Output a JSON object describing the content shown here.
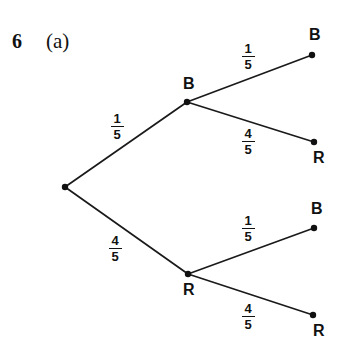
{
  "figure": {
    "question_number": "6",
    "part_label": "(a)",
    "type": "probability-tree-diagram",
    "line_color": "#1a1a1a",
    "background_color": "#ffffff",
    "text_color": "#111111"
  },
  "nodes": [
    {
      "id": "root",
      "label": "",
      "x": 65,
      "y": 187
    },
    {
      "id": "b1",
      "label": "B",
      "x": 187,
      "y": 102,
      "label_x": 183,
      "label_y": 76
    },
    {
      "id": "r1",
      "label": "R",
      "x": 188,
      "y": 274,
      "label_x": 183,
      "label_y": 282
    },
    {
      "id": "bb",
      "label": "B",
      "x": 312,
      "y": 55,
      "label_x": 309,
      "label_y": 27
    },
    {
      "id": "br",
      "label": "R",
      "x": 314,
      "y": 142,
      "label_x": 313,
      "label_y": 150
    },
    {
      "id": "rb",
      "label": "B",
      "x": 314,
      "y": 228,
      "label_x": 311,
      "label_y": 201
    },
    {
      "id": "rr",
      "label": "R",
      "x": 313,
      "y": 315,
      "label_x": 313,
      "label_y": 323
    }
  ],
  "edges": [
    {
      "id": "root-b1",
      "from": "root",
      "to": "b1",
      "numerator": "1",
      "denominator": "5",
      "label_x": 107,
      "label_y": 112
    },
    {
      "id": "root-r1",
      "from": "root",
      "to": "r1",
      "numerator": "4",
      "denominator": "5",
      "label_x": 105,
      "label_y": 234
    },
    {
      "id": "b1-bb",
      "from": "b1",
      "to": "bb",
      "numerator": "1",
      "denominator": "5",
      "label_x": 238,
      "label_y": 42
    },
    {
      "id": "b1-br",
      "from": "b1",
      "to": "br",
      "numerator": "4",
      "denominator": "5",
      "label_x": 238,
      "label_y": 127
    },
    {
      "id": "r1-rb",
      "from": "r1",
      "to": "rb",
      "numerator": "1",
      "denominator": "5",
      "label_x": 238,
      "label_y": 214
    },
    {
      "id": "r1-rr",
      "from": "r1",
      "to": "rr",
      "numerator": "4",
      "denominator": "5",
      "label_x": 238,
      "label_y": 302
    }
  ],
  "chart_data": {
    "type": "diagram",
    "subtype": "probability-tree",
    "title": "6 (a)",
    "outcomes": [
      {
        "path": [
          "B",
          "B"
        ],
        "probabilities": [
          "1/5",
          "1/5"
        ]
      },
      {
        "path": [
          "B",
          "R"
        ],
        "probabilities": [
          "1/5",
          "4/5"
        ]
      },
      {
        "path": [
          "R",
          "B"
        ],
        "probabilities": [
          "4/5",
          "1/5"
        ]
      },
      {
        "path": [
          "R",
          "R"
        ],
        "probabilities": [
          "4/5",
          "4/5"
        ]
      }
    ],
    "branch_labels": [
      "1/5",
      "4/5",
      "1/5",
      "4/5",
      "1/5",
      "4/5"
    ],
    "node_labels": [
      "B",
      "R",
      "B",
      "R",
      "B",
      "R"
    ]
  }
}
